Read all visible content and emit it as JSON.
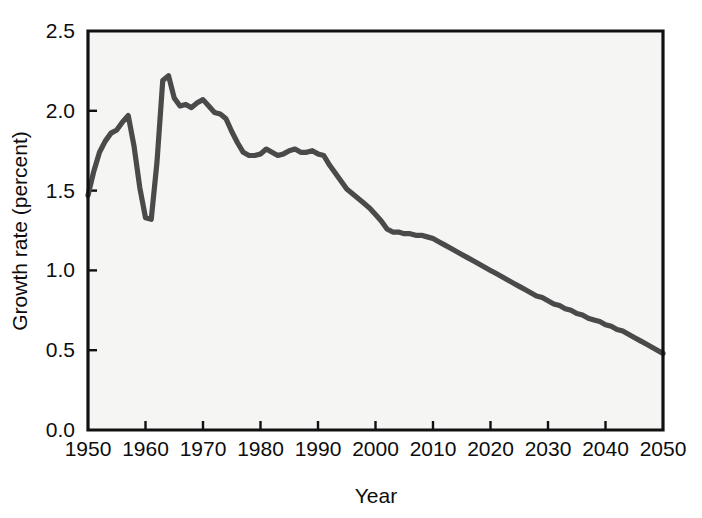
{
  "chart_data": {
    "type": "line",
    "title": "",
    "subtitle": "",
    "xlabel": "Year",
    "ylabel": "Growth rate (percent)",
    "xlim": [
      1950,
      2050
    ],
    "ylim": [
      0.0,
      2.5
    ],
    "xticks": [
      1950,
      1960,
      1970,
      1980,
      1990,
      2000,
      2010,
      2020,
      2030,
      2040,
      2050
    ],
    "xtick_labels": [
      "1950",
      "1960",
      "1970",
      "1980",
      "1990",
      "2000",
      "2010",
      "2020",
      "2030",
      "2040",
      "2050"
    ],
    "yticks": [
      0.0,
      0.5,
      1.0,
      1.5,
      2.0,
      2.5
    ],
    "ytick_labels": [
      "0.0",
      "0.5",
      "1.0",
      "1.5",
      "2.0",
      "2.5"
    ],
    "grid": false,
    "legend": false,
    "legend_position": "none",
    "line_color": "#4a4a4a",
    "axis_color": "#111111",
    "plot_background": "#f5f5f3",
    "series": [
      {
        "name": "World population growth rate",
        "x": [
          1950,
          1951,
          1952,
          1953,
          1954,
          1955,
          1956,
          1957,
          1958,
          1959,
          1960,
          1961,
          1962,
          1963,
          1964,
          1965,
          1966,
          1967,
          1968,
          1969,
          1970,
          1971,
          1972,
          1973,
          1974,
          1975,
          1976,
          1977,
          1978,
          1979,
          1980,
          1981,
          1982,
          1983,
          1984,
          1985,
          1986,
          1987,
          1988,
          1989,
          1990,
          1991,
          1992,
          1993,
          1994,
          1995,
          1996,
          1997,
          1998,
          1999,
          2000,
          2001,
          2002,
          2003,
          2004,
          2005,
          2006,
          2007,
          2008,
          2009,
          2010,
          2011,
          2012,
          2013,
          2014,
          2015,
          2016,
          2017,
          2018,
          2019,
          2020,
          2021,
          2022,
          2023,
          2024,
          2025,
          2026,
          2027,
          2028,
          2029,
          2030,
          2031,
          2032,
          2033,
          2034,
          2035,
          2036,
          2037,
          2038,
          2039,
          2040,
          2041,
          2042,
          2043,
          2044,
          2045,
          2046,
          2047,
          2048,
          2049,
          2050
        ],
        "y": [
          1.47,
          1.62,
          1.74,
          1.81,
          1.86,
          1.88,
          1.93,
          1.97,
          1.78,
          1.52,
          1.33,
          1.32,
          1.68,
          2.19,
          2.22,
          2.08,
          2.03,
          2.04,
          2.02,
          2.05,
          2.07,
          2.03,
          1.99,
          1.98,
          1.95,
          1.87,
          1.8,
          1.74,
          1.72,
          1.72,
          1.73,
          1.76,
          1.74,
          1.72,
          1.73,
          1.75,
          1.76,
          1.74,
          1.74,
          1.75,
          1.73,
          1.72,
          1.66,
          1.61,
          1.56,
          1.51,
          1.48,
          1.45,
          1.42,
          1.39,
          1.35,
          1.31,
          1.26,
          1.24,
          1.24,
          1.23,
          1.23,
          1.22,
          1.22,
          1.21,
          1.2,
          1.18,
          1.16,
          1.14,
          1.12,
          1.1,
          1.08,
          1.06,
          1.04,
          1.02,
          1.0,
          0.98,
          0.96,
          0.94,
          0.92,
          0.9,
          0.88,
          0.86,
          0.84,
          0.83,
          0.81,
          0.79,
          0.78,
          0.76,
          0.75,
          0.73,
          0.72,
          0.7,
          0.69,
          0.68,
          0.66,
          0.65,
          0.63,
          0.62,
          0.6,
          0.58,
          0.56,
          0.54,
          0.52,
          0.5,
          0.48
        ]
      }
    ]
  }
}
